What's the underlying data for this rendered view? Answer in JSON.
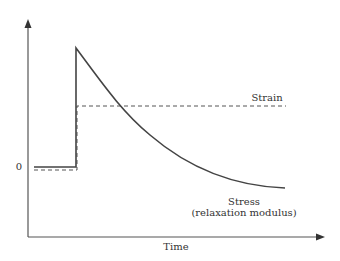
{
  "diagram": {
    "type": "stress-relaxation",
    "y_axis": {
      "tick_label": "0"
    },
    "x_axis": {
      "label": "Time"
    },
    "curves": [
      {
        "name": "Strain",
        "style": "dashed",
        "label": "Strain"
      },
      {
        "name": "Stress",
        "style": "solid",
        "label_line1": "Stress",
        "label_line2": "(relaxation modulus)"
      }
    ],
    "colors": {
      "axis": "#444444",
      "stress": "#444444",
      "strain": "#555555"
    }
  }
}
